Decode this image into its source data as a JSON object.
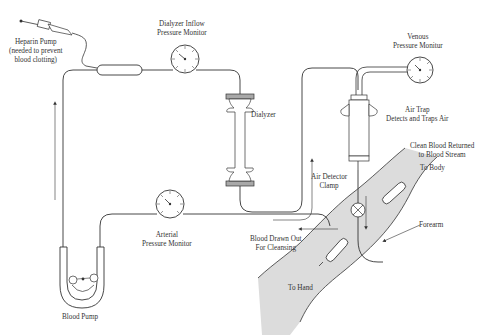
{
  "diagram": {
    "colors": {
      "line": "#333333",
      "arm_fill": "#dcdcdc",
      "dialyzer_cap": "#a8a8a8",
      "background": "#ffffff"
    },
    "labels": {
      "heparin_pump": [
        "Heparin Pump",
        "(needed to prevent",
        "blood clotting)"
      ],
      "dialyzer_inflow": [
        "Dialyzer Inflow",
        "Pressure Monitor"
      ],
      "venous_monitor": [
        "Venous",
        "Pressure Monitur"
      ],
      "dialyzer": [
        "Dialyzer"
      ],
      "air_trap": [
        "Air Trap",
        "Detects and Traps Air"
      ],
      "clean_blood": [
        "Clean Blood Returned",
        "to Blood Stream"
      ],
      "to_body": [
        "To Body"
      ],
      "air_detector_clamp": [
        "Air Detector",
        "Clamp"
      ],
      "arterial_monitor": [
        "Arterial",
        "Pressure Monitor"
      ],
      "blood_drawn": [
        "Blood Drawn Out",
        "For Cleansing"
      ],
      "forearm": [
        "Forearm"
      ],
      "to_hand": [
        "To Hand"
      ],
      "blood_pump": [
        "Blood Pump"
      ]
    },
    "components": [
      {
        "name": "heparin-pump",
        "type": "syringe"
      },
      {
        "name": "dialyzer-inflow-pressure-monitor",
        "type": "gauge"
      },
      {
        "name": "dialyzer",
        "type": "filter"
      },
      {
        "name": "venous-pressure-monitor",
        "type": "gauge"
      },
      {
        "name": "air-trap",
        "type": "chamber"
      },
      {
        "name": "air-detector-clamp",
        "type": "valve"
      },
      {
        "name": "arterial-pressure-monitor",
        "type": "gauge"
      },
      {
        "name": "blood-pump",
        "type": "roller-pump"
      },
      {
        "name": "forearm",
        "type": "anatomy"
      }
    ]
  }
}
